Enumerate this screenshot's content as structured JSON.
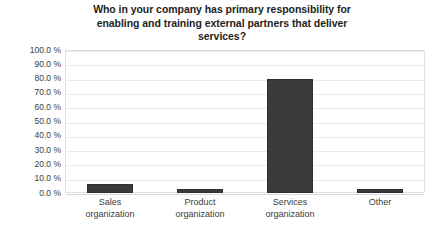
{
  "chart_data": {
    "type": "bar",
    "title_lines": [
      "Who in your company has primary responsibility for",
      "enabling and training external partners that deliver",
      "services?"
    ],
    "categories": [
      "Sales organization",
      "Product organization",
      "Services organization",
      "Other"
    ],
    "category_lines": [
      [
        "Sales",
        "organization"
      ],
      [
        "Product",
        "organization"
      ],
      [
        "Services",
        "organization"
      ],
      [
        "Other"
      ]
    ],
    "values": [
      6,
      3,
      80,
      3
    ],
    "xlabel": "",
    "ylabel": "",
    "ylim": [
      0,
      100
    ],
    "ytick_step": 10,
    "ytick_labels": [
      "100.0 %",
      "90.0 %",
      "80.0 %",
      "70.0 %",
      "60.0 %",
      "50.0 %",
      "40.0 %",
      "30.0 %",
      "20.0 %",
      "10.0 %",
      "0.0 %"
    ],
    "ytick_values": [
      100,
      90,
      80,
      70,
      60,
      50,
      40,
      30,
      20,
      10,
      0
    ],
    "grid": true,
    "legend": false,
    "colors": {
      "bar": "#3a3a3a",
      "bar_border": "#2f2f2f",
      "gridline": "#eaeaea",
      "plot_border": "#e2e2e2",
      "background": "#ffffff",
      "title_text": "#231f20",
      "axis_text": "#3c3c3c"
    }
  }
}
